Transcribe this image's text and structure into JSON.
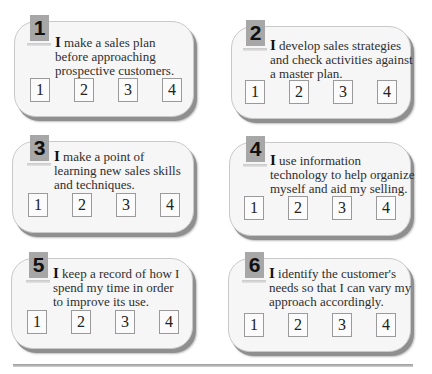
{
  "items": [
    {
      "number": "1",
      "first": "I",
      "text_lines": [
        " make a sales plan",
        "before approaching",
        "prospective customers."
      ],
      "scale": [
        "1",
        "2",
        "3",
        "4"
      ]
    },
    {
      "number": "2",
      "first": "I",
      "text_lines": [
        " develop sales strategies",
        "and check activities against",
        "a master plan."
      ],
      "scale": [
        "1",
        "2",
        "3",
        "4"
      ]
    },
    {
      "number": "3",
      "first": "I",
      "text_lines": [
        " make a point of",
        "learning new sales skills",
        "and techniques."
      ],
      "scale": [
        "1",
        "2",
        "3",
        "4"
      ]
    },
    {
      "number": "4",
      "first": "I",
      "text_lines": [
        " use information",
        "technology to help organize",
        "myself and aid my selling."
      ],
      "scale": [
        "1",
        "2",
        "3",
        "4"
      ]
    },
    {
      "number": "5",
      "first": "I",
      "text_lines": [
        " keep a record of how I",
        "spend my time in order",
        "to improve its use."
      ],
      "scale": [
        "1",
        "2",
        "3",
        "4"
      ]
    },
    {
      "number": "6",
      "first": "I",
      "text_lines": [
        " identify the customer's",
        "needs so that I can vary my",
        "approach accordingly."
      ],
      "scale": [
        "1",
        "2",
        "3",
        "4"
      ]
    }
  ],
  "colors": {
    "card_bg": "#f6f6f6",
    "badge_bg": "#a7a7a7",
    "shadow": "#8f8f8f"
  }
}
